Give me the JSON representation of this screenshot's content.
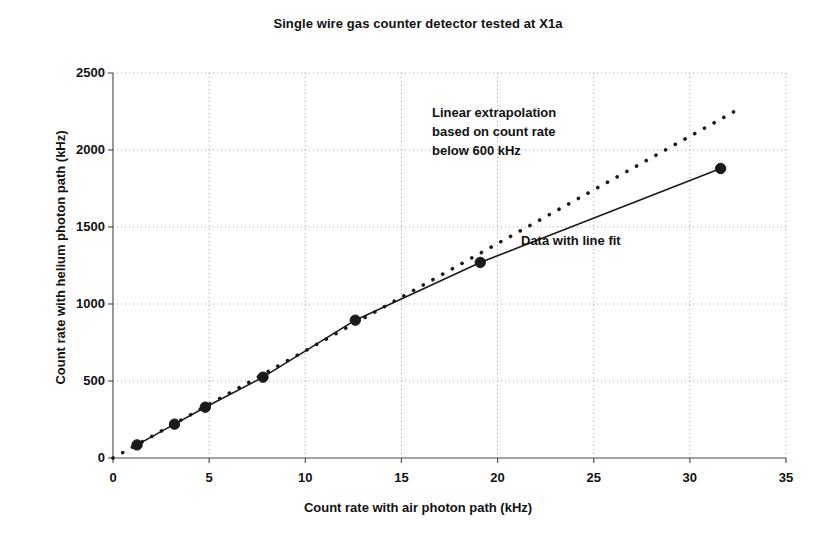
{
  "chart_data": {
    "type": "scatter",
    "title": "Single wire gas counter detector tested at X1a",
    "xlabel": "Count rate with air photon path (kHz)",
    "ylabel": "Count rate with helium photon path (kHz)",
    "xlim": [
      0,
      35
    ],
    "ylim": [
      0,
      2500
    ],
    "xticks": [
      0,
      5,
      10,
      15,
      20,
      25,
      30,
      35
    ],
    "yticks": [
      0,
      500,
      1000,
      1500,
      2000,
      2500
    ],
    "xtick_labels": [
      "0",
      "5",
      "10",
      "15",
      "20",
      "25",
      "30",
      "35"
    ],
    "ytick_labels": [
      "0",
      "500",
      "1000",
      "1500",
      "2000",
      "2500"
    ],
    "grid": "both-dotted",
    "legend": "none",
    "series": [
      {
        "name": "Data with line fit",
        "style": "solid-line-with-markers",
        "color": "#1a1a1a",
        "marker": "filled-circle",
        "x": [
          1.25,
          3.2,
          4.8,
          7.8,
          12.6,
          19.1,
          31.6
        ],
        "y": [
          85,
          220,
          330,
          525,
          895,
          1270,
          1880
        ]
      },
      {
        "name": "Linear extrapolation based on count rate below 600 kHz",
        "style": "dotted-line",
        "color": "#1a1a1a",
        "x": [
          0,
          32.6
        ],
        "y": [
          0,
          2270
        ]
      }
    ],
    "annotations": [
      {
        "id": "extrapolation-note",
        "text": "Linear extrapolation\nbased on count rate\nbelow 600 kHz",
        "x": 16.6,
        "y": 2180
      },
      {
        "id": "data-fit-note",
        "text": "Data with line fit",
        "x": 21.2,
        "y": 1440
      }
    ]
  },
  "chart": {
    "title": "Single wire gas counter detector tested at X1a",
    "x_axis_title": "Count rate with air photon path (kHz)",
    "y_axis_title": "Count rate with helium photon path (kHz)",
    "annotation_extrapolation": "Linear extrapolation\nbased on count rate\nbelow 600 kHz",
    "annotation_datafit": "Data with line fit"
  }
}
